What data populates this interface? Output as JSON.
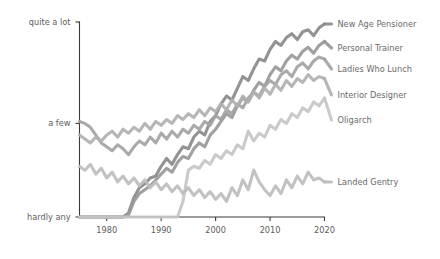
{
  "chart_data": {
    "type": "line",
    "title": "",
    "subtitle": "",
    "xlabel": "",
    "ylabel": "",
    "grid": false,
    "legend_position": "right-inline-end-of-line",
    "x": [
      1975,
      1976,
      1977,
      1978,
      1979,
      1980,
      1981,
      1982,
      1983,
      1984,
      1985,
      1986,
      1987,
      1988,
      1989,
      1990,
      1991,
      1992,
      1993,
      1994,
      1995,
      1996,
      1997,
      1998,
      1999,
      2000,
      2001,
      2002,
      2003,
      2004,
      2005,
      2006,
      2007,
      2008,
      2009,
      2010,
      2011,
      2012,
      2013,
      2014,
      2015,
      2016,
      2017,
      2018,
      2019,
      2020
    ],
    "xlim": [
      1975,
      2020
    ],
    "ylim": [
      0,
      10
    ],
    "xticks": [
      1980,
      1990,
      2000,
      2010,
      2020
    ],
    "xticklabels": [
      "1980",
      "1990",
      "2000",
      "2010",
      "2020"
    ],
    "yticks": [
      0,
      4.8,
      10
    ],
    "yticklabels": [
      "hardly any",
      "a few",
      "quite a lot"
    ],
    "series": [
      {
        "name": "New Age Pensioner",
        "color": "#8a8a8a",
        "label_y": 24,
        "values": [
          0,
          0,
          0,
          0,
          0,
          0,
          0,
          0,
          0,
          0.2,
          1.0,
          1.5,
          1.7,
          2.0,
          2.1,
          2.6,
          3.0,
          2.7,
          3.2,
          3.6,
          3.5,
          4.1,
          4.4,
          4.2,
          4.9,
          5.2,
          5.8,
          6.2,
          6.0,
          6.6,
          7.2,
          7.0,
          7.6,
          8.1,
          8.0,
          8.6,
          9.0,
          8.8,
          9.2,
          9.4,
          9.1,
          9.5,
          9.6,
          9.3,
          9.7,
          9.9
        ]
      },
      {
        "name": "Personal Trainer",
        "color": "#989898",
        "label_y": 48,
        "values": [
          0,
          0,
          0,
          0,
          0,
          0,
          0,
          0,
          0,
          0.1,
          0.8,
          1.2,
          1.4,
          1.6,
          1.9,
          2.2,
          2.5,
          2.3,
          2.8,
          3.1,
          3.0,
          3.5,
          3.8,
          3.6,
          4.2,
          4.5,
          4.9,
          5.3,
          5.1,
          5.7,
          6.1,
          5.9,
          6.5,
          6.9,
          6.7,
          7.3,
          7.7,
          7.5,
          8.0,
          8.3,
          8.1,
          8.5,
          8.7,
          8.4,
          8.8,
          9.0
        ]
      },
      {
        "name": "Ladies Who Lunch",
        "color": "#a3a3a3",
        "label_y": 69,
        "values": [
          4.9,
          4.8,
          4.6,
          4.2,
          3.8,
          3.6,
          3.4,
          3.7,
          3.5,
          3.2,
          3.6,
          3.9,
          3.7,
          4.1,
          3.8,
          4.3,
          4.0,
          4.4,
          4.1,
          4.5,
          4.3,
          4.7,
          4.5,
          4.9,
          4.7,
          5.2,
          5.0,
          5.5,
          5.3,
          5.8,
          5.6,
          6.1,
          6.4,
          6.2,
          6.7,
          7.0,
          6.8,
          7.3,
          7.5,
          7.2,
          7.7,
          7.9,
          7.6,
          8.0,
          8.2,
          8.1
        ]
      },
      {
        "name": "Interior Designer",
        "color": "#b0b0b0",
        "label_y": 95,
        "values": [
          4.2,
          4.0,
          3.8,
          4.1,
          3.9,
          4.2,
          4.4,
          4.1,
          4.5,
          4.3,
          4.6,
          4.4,
          4.8,
          4.5,
          4.9,
          4.7,
          5.0,
          4.8,
          5.2,
          5.0,
          5.3,
          5.1,
          5.5,
          5.2,
          5.6,
          5.4,
          5.8,
          5.5,
          6.0,
          5.7,
          6.2,
          5.9,
          6.4,
          6.1,
          6.6,
          6.3,
          6.8,
          6.5,
          7.0,
          6.7,
          7.1,
          6.9,
          7.3,
          7.0,
          7.2,
          7.1
        ]
      },
      {
        "name": "Oligarch",
        "color": "#c6c6c6",
        "label_y": 120,
        "values": [
          0,
          0,
          0,
          0,
          0,
          0,
          0,
          0,
          0,
          0,
          0,
          0,
          0,
          0,
          0,
          0,
          0,
          0,
          0,
          0.8,
          2.4,
          2.6,
          2.5,
          2.9,
          2.7,
          3.2,
          3.0,
          3.4,
          3.2,
          3.7,
          3.5,
          4.4,
          3.9,
          4.3,
          4.1,
          4.7,
          4.5,
          5.0,
          4.8,
          5.3,
          5.1,
          5.6,
          5.4,
          5.9,
          5.7,
          6.1
        ]
      },
      {
        "name": "Landed Gentry",
        "color": "#bdbdbd",
        "label_y": 182,
        "values": [
          2.6,
          2.4,
          2.7,
          2.2,
          2.5,
          2.0,
          2.3,
          1.8,
          2.1,
          1.7,
          2.0,
          1.6,
          1.9,
          1.5,
          1.8,
          1.4,
          1.7,
          1.3,
          1.6,
          1.2,
          1.5,
          1.1,
          1.4,
          1.0,
          1.3,
          0.9,
          1.2,
          0.8,
          1.5,
          1.1,
          1.9,
          1.4,
          2.4,
          1.8,
          1.4,
          1.1,
          1.6,
          1.2,
          1.9,
          1.5,
          2.1,
          1.7,
          2.3,
          1.9,
          2.0,
          1.8
        ]
      }
    ]
  }
}
